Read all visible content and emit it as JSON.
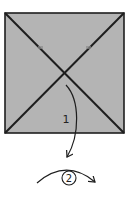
{
  "diagram": {
    "type": "origami-step",
    "paper_color": "#b4b4b4",
    "line_color": "#1e1e1e",
    "square": {
      "x": 5,
      "y": 13,
      "w": 119,
      "h": 120
    },
    "creases": [
      "diagonal-tl-br",
      "diagonal-tr-bl"
    ],
    "steps": [
      {
        "number": "1",
        "action": "fold-down-arrow"
      },
      {
        "number": "2",
        "action": "turn-over-arrow",
        "circled": true
      }
    ]
  }
}
